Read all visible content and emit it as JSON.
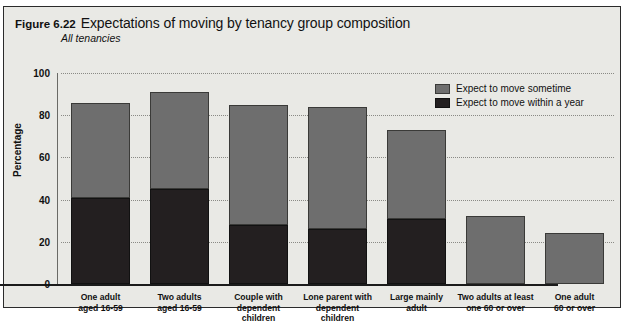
{
  "figure": {
    "number": "Figure 6.22",
    "title": "Expectations of moving by tenancy group composition",
    "subtitle": "All tenancies"
  },
  "legend": {
    "position": "top-right",
    "items": [
      {
        "label": "Expect to move sometime",
        "color": "#6e6e6e",
        "name": "sometime"
      },
      {
        "label": "Expect to move within a year",
        "color": "#231f20",
        "name": "within-a-year"
      }
    ]
  },
  "chart_data": {
    "type": "bar",
    "stacked": true,
    "title": "Expectations of moving by tenancy group composition",
    "subtitle": "All tenancies",
    "xlabel": "",
    "ylabel": "Percentage",
    "ylim": [
      0,
      100
    ],
    "yticks": [
      0,
      20,
      40,
      60,
      80,
      100
    ],
    "ytick_labels": [
      "0",
      "20",
      "40",
      "60",
      "80",
      "100"
    ],
    "grid": true,
    "grid_axis": "y",
    "legend_position": "top-right",
    "categories": [
      "One adult\naged 16-59",
      "Two adults\naged 16-59",
      "Couple with\ndependent children",
      "Lone parent with\ndependent children",
      "Large mainly\nadult",
      "Two adults at least\none 60 or over",
      "One adult\n60 or over"
    ],
    "series": [
      {
        "name": "Expect to move within a year",
        "color": "#231f20",
        "values": [
          41,
          45,
          28,
          26,
          31,
          0,
          0
        ]
      },
      {
        "name": "Expect to move sometime",
        "color": "#6e6e6e",
        "values": [
          45,
          46,
          57,
          58,
          42,
          32,
          24
        ]
      }
    ],
    "totals": [
      86,
      91,
      85,
      84,
      73,
      32,
      24
    ]
  }
}
